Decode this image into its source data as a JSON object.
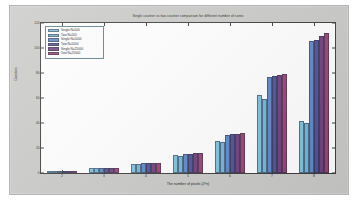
{
  "chart_data": {
    "type": "bar",
    "title": "Single counter vs two counter comparison for different number of cores",
    "xlabel": "The number of pixels (2^n)",
    "ylabel": "Duration",
    "categories": [
      "2",
      "3",
      "4",
      "5",
      "6",
      "7",
      "8"
    ],
    "xtick_labels": [
      "2",
      "3",
      "4",
      "5",
      "6",
      "7",
      "8"
    ],
    "ytick_labels": [
      "0",
      "20",
      "40",
      "60",
      "80",
      "100",
      "120"
    ],
    "ylim": [
      0,
      120
    ],
    "grid": false,
    "legend_position": "upper left",
    "series": [
      {
        "name": "Single  N=500",
        "color": "#7ec2dc",
        "values": [
          0.8,
          4.0,
          7.6,
          14.2,
          26.0,
          62.5,
          42.0
        ]
      },
      {
        "name": "Two     N=500",
        "color": "#6fb5d8",
        "values": [
          0.9,
          3.9,
          7.4,
          13.9,
          24.8,
          59.5,
          40.0
        ]
      },
      {
        "name": "Single  N=5000",
        "color": "#5b87c8",
        "values": [
          1.0,
          4.1,
          7.9,
          15.6,
          30.2,
          76.5,
          106.0
        ]
      },
      {
        "name": "Two     N=5000",
        "color": "#4f4f96",
        "values": [
          1.0,
          4.0,
          7.8,
          15.5,
          31.2,
          77.5,
          106.5
        ]
      },
      {
        "name": "Single  N=25000",
        "color": "#6e3f7e",
        "values": [
          1.1,
          4.2,
          8.0,
          15.8,
          31.6,
          78.5,
          110.0
        ]
      },
      {
        "name": "Two     N=25000",
        "color": "#9c3f72",
        "values": [
          1.1,
          4.2,
          8.2,
          16.0,
          32.0,
          79.5,
          112.0
        ]
      }
    ]
  }
}
